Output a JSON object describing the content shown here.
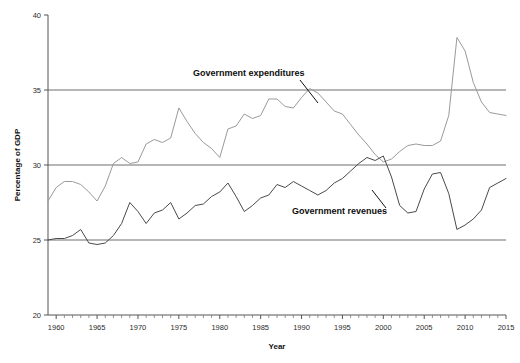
{
  "chart_data": {
    "type": "line",
    "title": "",
    "xlabel": "Year",
    "ylabel": "Percentage of GDP",
    "xlim": [
      1959,
      2015
    ],
    "ylim": [
      20,
      40
    ],
    "grid": true,
    "gridlines_y": [
      25,
      30,
      35
    ],
    "legend_position": "inline-annotations",
    "x_ticks_major": [
      1960,
      1965,
      1970,
      1975,
      1980,
      1985,
      1990,
      1995,
      2000,
      2005,
      2010,
      2015
    ],
    "x_tick_labels": [
      "1960",
      "1965",
      "1970",
      "1975",
      "1980",
      "1985",
      "1990",
      "1995",
      "2000",
      "2005",
      "2010",
      "2015"
    ],
    "y_ticks": [
      20,
      25,
      30,
      35,
      40
    ],
    "y_tick_labels": [
      "20",
      "25",
      "30",
      "35",
      "40"
    ],
    "x": [
      1959,
      1960,
      1961,
      1962,
      1963,
      1964,
      1965,
      1966,
      1967,
      1968,
      1969,
      1970,
      1971,
      1972,
      1973,
      1974,
      1975,
      1976,
      1977,
      1978,
      1979,
      1980,
      1981,
      1982,
      1983,
      1984,
      1985,
      1986,
      1987,
      1988,
      1989,
      1990,
      1991,
      1992,
      1993,
      1994,
      1995,
      1996,
      1997,
      1998,
      1999,
      2000,
      2001,
      2002,
      2003,
      2004,
      2005,
      2006,
      2007,
      2008,
      2009,
      2010,
      2011,
      2012,
      2013,
      2014,
      2015
    ],
    "series": [
      {
        "name": "Government expenditures",
        "color": "#9a9a9a",
        "label_text": "Government expenditures",
        "values": [
          27.6,
          28.5,
          28.9,
          28.9,
          28.7,
          28.2,
          27.6,
          28.6,
          30.1,
          30.5,
          30.1,
          30.2,
          31.4,
          31.7,
          31.5,
          31.8,
          33.8,
          32.9,
          32.1,
          31.5,
          31.1,
          30.5,
          32.4,
          32.6,
          33.4,
          33.1,
          33.3,
          34.4,
          34.4,
          33.9,
          33.8,
          34.5,
          35.1,
          34.8,
          34.2,
          33.6,
          33.4,
          32.7,
          32.0,
          31.4,
          30.7,
          30.2,
          30.4,
          30.9,
          31.3,
          31.4,
          31.3,
          31.3,
          31.6,
          33.3,
          38.5,
          37.6,
          35.5,
          34.2,
          33.5,
          33.4,
          33.3
        ]
      },
      {
        "name": "Government revenues",
        "color": "#4a4a4a",
        "label_text": "Government revenues",
        "values": [
          25.0,
          25.1,
          25.1,
          25.3,
          25.7,
          24.8,
          24.7,
          24.8,
          25.3,
          26.1,
          27.5,
          26.9,
          26.1,
          26.8,
          27.0,
          27.5,
          26.4,
          26.8,
          27.3,
          27.4,
          27.9,
          28.2,
          28.8,
          27.9,
          26.9,
          27.3,
          27.8,
          28.0,
          28.7,
          28.5,
          28.9,
          28.6,
          28.3,
          28.0,
          28.3,
          28.8,
          29.1,
          29.6,
          30.1,
          30.5,
          30.3,
          30.6,
          29.2,
          27.3,
          26.8,
          26.9,
          28.4,
          29.4,
          29.5,
          28.1,
          25.7,
          26.0,
          26.4,
          27.0,
          28.5,
          28.8,
          29.1
        ]
      }
    ],
    "annotations": [
      {
        "text": "Government expenditures",
        "x_px": 193,
        "y_px": 76,
        "leader_from": [
          300,
          80
        ],
        "leader_to": [
          318,
          103
        ]
      },
      {
        "text": "Government revenues",
        "x_px": 292,
        "y_px": 214,
        "leader_from": [
          386,
          208
        ],
        "leader_to": [
          372,
          190
        ]
      }
    ]
  },
  "axes": {
    "y_title": "Percentage of GDP",
    "x_title": "Year"
  }
}
